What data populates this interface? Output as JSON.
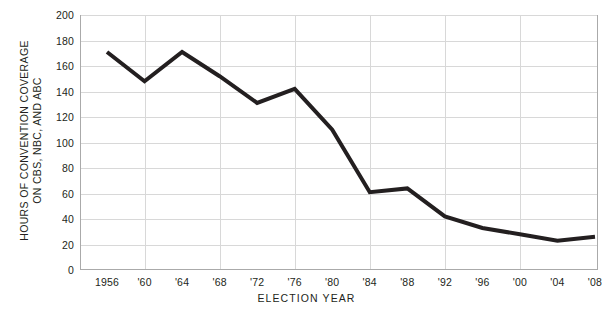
{
  "chart_data": {
    "type": "line",
    "title": "",
    "xlabel": "ELECTION YEAR",
    "ylabel_lines": [
      "HOURS OF CONVENTION COVERAGE",
      "ON CBS, NBC, AND ABC"
    ],
    "ylabel": "HOURS OF CONVENTION COVERAGE ON CBS, NBC, AND ABC",
    "categories": [
      "1956",
      "'60",
      "'64",
      "'68",
      "'72",
      "'76",
      "'80",
      "'84",
      "'88",
      "'92",
      "'96",
      "'00",
      "'04",
      "'08"
    ],
    "x": [
      1956,
      1960,
      1964,
      1968,
      1972,
      1976,
      1980,
      1984,
      1988,
      1992,
      1996,
      2000,
      2004,
      2008
    ],
    "values": [
      171,
      148,
      171,
      152,
      131,
      142,
      110,
      61,
      64,
      42,
      33,
      28,
      23,
      26
    ],
    "ylim": [
      0,
      200
    ],
    "ytick_values": [
      0,
      20,
      40,
      60,
      80,
      100,
      120,
      140,
      160,
      180,
      200
    ],
    "ytick_labels": [
      "0",
      "20",
      "40",
      "60",
      "80",
      "100",
      "120",
      "140",
      "160",
      "180",
      "200"
    ],
    "grid": {
      "horizontal": true,
      "vertical": true,
      "vertical_at": [
        "'60",
        "'68",
        "'76",
        "'84",
        "'92",
        "'00"
      ],
      "color": "#d8d8d8"
    },
    "legend": "none",
    "series_color": "#231f20",
    "series_width_px": 4,
    "axis_color": "#aaaaaa",
    "background": "#ffffff"
  }
}
